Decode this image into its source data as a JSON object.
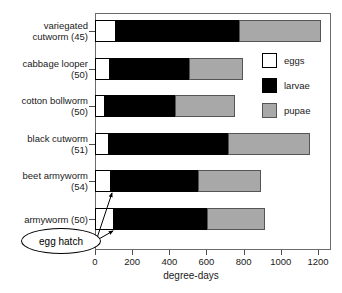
{
  "chart_data": {
    "type": "bar",
    "orientation": "horizontal",
    "stacked": true,
    "title": "",
    "xlabel": "degree-days",
    "ylabel": "",
    "xlim": [
      0,
      1300
    ],
    "xticks": [
      0,
      200,
      400,
      600,
      800,
      1000,
      1200
    ],
    "xtick_labels": [
      "0",
      "200",
      "400",
      "600",
      "800",
      "1000",
      "1200"
    ],
    "grid": false,
    "legend_position": "upper right",
    "categories": [
      "variegated cutworm (45)",
      "cabbage looper (50)",
      "cotton bollworm (50)",
      "black cutworm (51)",
      "beet armyworm (54)",
      "armyworm (50)"
    ],
    "series": [
      {
        "name": "eggs",
        "color": "#ffffff",
        "values": [
          113,
          81,
          52,
          75,
          86,
          102
        ]
      },
      {
        "name": "larvae",
        "color": "#000000",
        "values": [
          662,
          425,
          378,
          641,
          468,
          501
        ]
      },
      {
        "name": "pupae",
        "color": "#a8a8a8",
        "values": [
          441,
          291,
          323,
          441,
          339,
          312
        ]
      }
    ],
    "cumulative_ends": [
      {
        "category": "variegated cutworm (45)",
        "eggs_end": 113,
        "larvae_end": 775,
        "pupae_end": 1216
      },
      {
        "category": "cabbage looper (50)",
        "eggs_end": 81,
        "larvae_end": 506,
        "pupae_end": 797
      },
      {
        "category": "cotton bollworm (50)",
        "eggs_end": 52,
        "larvae_end": 430,
        "pupae_end": 753
      },
      {
        "category": "black cutworm (51)",
        "eggs_end": 75,
        "larvae_end": 716,
        "pupae_end": 1157
      },
      {
        "category": "beet armyworm (54)",
        "eggs_end": 86,
        "larvae_end": 554,
        "pupae_end": 893
      },
      {
        "category": "armyworm (50)",
        "eggs_end": 102,
        "larvae_end": 603,
        "pupae_end": 915
      }
    ],
    "annotations": [
      {
        "text": "egg hatch",
        "points_to": [
          "beet armyworm (54) eggs end",
          "armyworm (50) eggs end"
        ]
      }
    ]
  },
  "axis": {
    "x_title": "degree-days",
    "tick_labels": [
      "0",
      "200",
      "400",
      "600",
      "800",
      "1000",
      "1200"
    ]
  },
  "category_labels": [
    {
      "line1": "variegated",
      "line2": "cutworm (45)",
      "full": "variegated\ncutworm (45)"
    },
    {
      "line1": "cabbage looper",
      "line2": "(50)",
      "full": "cabbage looper\n(50)"
    },
    {
      "line1": "cotton bollworm",
      "line2": "(50)",
      "full": "cotton bollworm\n(50)"
    },
    {
      "line1": "black cutworm",
      "line2": "(51)",
      "full": "black cutworm\n(51)"
    },
    {
      "line1": "beet armyworm",
      "line2": "(54)",
      "full": "beet armyworm\n(54)"
    },
    {
      "line1": "armyworm (50)",
      "line2": "",
      "full": "armyworm (50)"
    }
  ],
  "legend": {
    "items": [
      {
        "label": "eggs",
        "color": "#ffffff"
      },
      {
        "label": "larvae",
        "color": "#000000"
      },
      {
        "label": "pupae",
        "color": "#a8a8a8"
      }
    ]
  },
  "annotation": {
    "label": "egg hatch"
  }
}
